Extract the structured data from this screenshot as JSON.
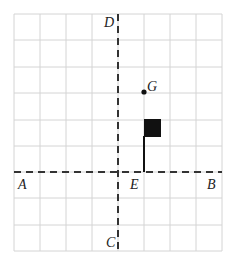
{
  "diagram": {
    "grid": {
      "cols": 8,
      "rows": 9,
      "left": 14,
      "top": 14,
      "cell_w": 26,
      "cell_h": 26.2,
      "color": "#d4d4d4"
    },
    "axes": {
      "horizontal_y": 172,
      "vertical_x": 118,
      "color": "#333333"
    },
    "labels": {
      "A": "A",
      "B": "B",
      "C": "C",
      "D": "D",
      "E": "E",
      "G": "G"
    },
    "point_G": {
      "x": 144,
      "y": 92
    },
    "flag": {
      "pole_x": 144,
      "pole_top": 137,
      "pole_bottom": 172,
      "square": {
        "x": 144,
        "y": 119,
        "w": 17,
        "h": 18
      },
      "color": "#111111"
    }
  }
}
